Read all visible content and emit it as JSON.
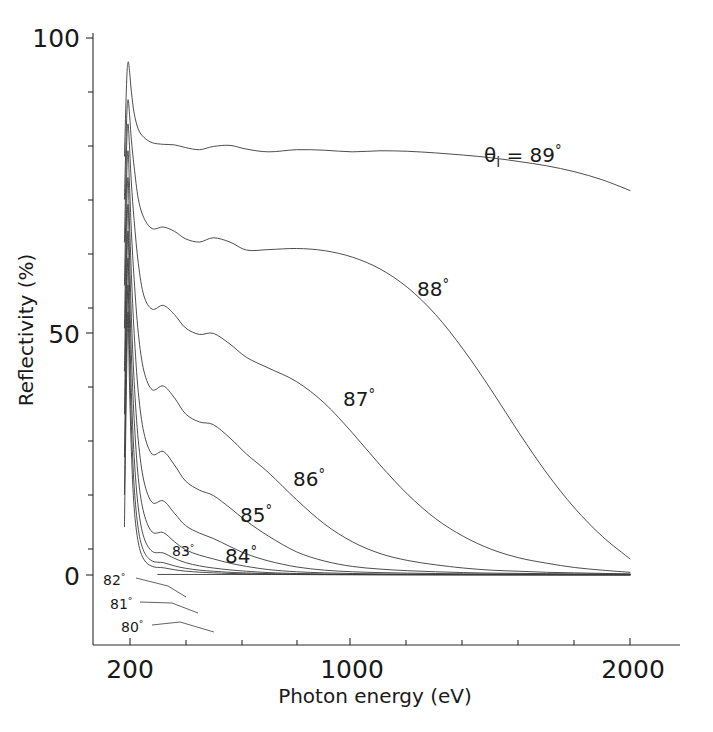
{
  "figure": {
    "background": "#ffffff",
    "line_color": "#3a3a3a",
    "axis_color": "#2b2b2b"
  },
  "axes": {
    "x_title": "Photon energy (eV)",
    "y_title": "Reflectivity (%)",
    "x_tick_labels": [
      "200",
      "1000",
      "2000"
    ],
    "y_tick_labels": [
      "100",
      "50",
      "0"
    ]
  },
  "labels": {
    "theta_main": "θ",
    "theta_sub": "i",
    "theta_eq": " = 89",
    "deg": "°",
    "c88": "88",
    "c87": "87",
    "c86": "86",
    "c85": "85",
    "c84": "84",
    "c83": "83",
    "c82": "82",
    "c81": "81",
    "c80": "80"
  },
  "chart_data": {
    "type": "line",
    "title": "",
    "subtitle": "",
    "xlabel": "Photon energy (eV)",
    "ylabel": "Reflectivity (%)",
    "xlim": [
      130,
      2000
    ],
    "ylim": [
      -10,
      100
    ],
    "x_scale": "linear",
    "y_scale": "linear",
    "xticks": [
      200,
      400,
      600,
      800,
      1000,
      1200,
      1400,
      1600,
      1800,
      2000
    ],
    "xticklabels": {
      "200": "200",
      "1000": "1000",
      "2000": "2000"
    },
    "yticks": [
      0,
      10,
      20,
      30,
      40,
      50,
      60,
      70,
      80,
      90,
      100
    ],
    "yticklabels": {
      "0": "0",
      "50": "50",
      "100": "100"
    },
    "grid": false,
    "legend": "inline-curve-annotations",
    "annotations": [
      {
        "text": "θi = 89°",
        "x": 1290,
        "y": 78.5
      },
      {
        "text": "88°",
        "x": 1090,
        "y": 54.0
      },
      {
        "text": "87°",
        "x": 810,
        "y": 34.5
      },
      {
        "text": "86°",
        "x": 625,
        "y": 19.5
      },
      {
        "text": "85°",
        "x": 440,
        "y": 13.0
      },
      {
        "text": "84°",
        "x": 415,
        "y": 5.0
      },
      {
        "text": "83°",
        "x": 300,
        "y": 5.8
      },
      {
        "text": "82°",
        "x": 205,
        "y": -1.0
      },
      {
        "text": "81°",
        "x": 218,
        "y": -5.5
      },
      {
        "text": "80°",
        "x": 250,
        "y": -9.0
      }
    ],
    "series": [
      {
        "name": "θi = 89°",
        "label": "89°",
        "x": [
          180,
          188,
          193,
          198,
          205,
          215,
          230,
          250,
          280,
          320,
          360,
          400,
          450,
          500,
          560,
          620,
          700,
          800,
          900,
          1000,
          1100,
          1200,
          1300,
          1400,
          1500,
          1600,
          1700,
          1800,
          1900,
          2000
        ],
        "y": [
          78,
          92,
          95.5,
          94,
          90,
          86,
          83,
          81.5,
          80.5,
          80.2,
          80.1,
          79.6,
          79.2,
          79.8,
          80.0,
          79.3,
          78.8,
          79.2,
          79.1,
          78.8,
          79.0,
          78.9,
          78.6,
          78.2,
          77.7,
          77.0,
          76.2,
          75.1,
          73.6,
          71.6
        ]
      },
      {
        "name": "88°",
        "label": "88°",
        "x": [
          180,
          188,
          193,
          198,
          205,
          215,
          230,
          250,
          280,
          320,
          360,
          400,
          450,
          500,
          560,
          620,
          700,
          800,
          900,
          1000,
          1100,
          1200,
          1300,
          1400,
          1500,
          1600,
          1700,
          1800,
          1900,
          2000
        ],
        "y": [
          70,
          85,
          88.5,
          86,
          81,
          76,
          70,
          66.5,
          64.5,
          64.8,
          64.0,
          62.6,
          62.0,
          62.8,
          62.0,
          60.5,
          60.6,
          60.8,
          60.4,
          59.2,
          57.0,
          53.5,
          48.5,
          42.0,
          34.5,
          26.5,
          19.0,
          12.5,
          7.2,
          3.0
        ]
      },
      {
        "name": "87°",
        "label": "87°",
        "x": [
          180,
          188,
          193,
          198,
          205,
          215,
          230,
          250,
          280,
          320,
          360,
          400,
          450,
          500,
          560,
          620,
          700,
          800,
          900,
          1000,
          1100,
          1200,
          1300,
          1400,
          1500,
          1600,
          1700,
          1800,
          1900,
          2000
        ],
        "y": [
          62,
          80,
          84,
          80,
          73,
          66,
          58,
          52,
          49.5,
          50.2,
          48.5,
          46.0,
          44.8,
          45.0,
          43.0,
          40.5,
          38.5,
          36.0,
          32.0,
          26.5,
          20.5,
          15.0,
          10.5,
          7.2,
          4.8,
          3.2,
          2.2,
          1.4,
          0.9,
          0.5
        ]
      },
      {
        "name": "86°",
        "label": "86°",
        "x": [
          180,
          188,
          193,
          198,
          205,
          215,
          230,
          250,
          280,
          320,
          360,
          400,
          450,
          500,
          560,
          620,
          700,
          800,
          900,
          1000,
          1100,
          1200,
          1300,
          1400,
          1500,
          1600,
          1700,
          1800,
          1900,
          2000
        ],
        "y": [
          54,
          74,
          79,
          73,
          64,
          55,
          45,
          38,
          34.5,
          35.2,
          33.0,
          30.0,
          28.5,
          28.0,
          25.5,
          22.5,
          19.0,
          14.0,
          9.5,
          6.2,
          4.0,
          2.7,
          1.9,
          1.3,
          0.9,
          0.7,
          0.5,
          0.4,
          0.3,
          0.2
        ]
      },
      {
        "name": "85°",
        "label": "85°",
        "x": [
          180,
          188,
          193,
          198,
          205,
          215,
          230,
          250,
          280,
          320,
          360,
          400,
          450,
          500,
          560,
          620,
          700,
          800,
          900,
          1000,
          1100,
          1200,
          1300,
          1400,
          1500,
          1600,
          1700,
          1800,
          1900,
          2000
        ],
        "y": [
          46,
          68,
          74,
          66,
          56,
          45,
          34,
          26.5,
          22.5,
          23.0,
          20.5,
          17.5,
          15.8,
          14.8,
          12.5,
          10.0,
          7.2,
          4.3,
          2.6,
          1.6,
          1.1,
          0.8,
          0.6,
          0.45,
          0.35,
          0.3,
          0.25,
          0.2,
          0.18,
          0.15
        ]
      },
      {
        "name": "84°",
        "label": "84°",
        "x": [
          180,
          188,
          193,
          198,
          205,
          215,
          230,
          250,
          280,
          320,
          360,
          400,
          450,
          500,
          560,
          620,
          700,
          800,
          900,
          1000,
          1100,
          1200,
          1300,
          1400,
          1500,
          1600,
          1700,
          1800,
          1900,
          2000
        ],
        "y": [
          38,
          62,
          69,
          60,
          48,
          36,
          25,
          17.5,
          13.5,
          13.8,
          11.5,
          9.2,
          7.8,
          6.8,
          5.3,
          3.9,
          2.6,
          1.5,
          0.9,
          0.6,
          0.45,
          0.35,
          0.28,
          0.22,
          0.18,
          0.16,
          0.14,
          0.12,
          0.1,
          0.1
        ]
      },
      {
        "name": "83°",
        "label": "83°",
        "x": [
          180,
          188,
          193,
          198,
          205,
          215,
          230,
          250,
          280,
          320,
          360,
          400,
          450,
          500,
          560,
          620,
          700,
          800,
          900,
          1000,
          1100,
          1200,
          1300,
          1400,
          1500,
          1600,
          1700,
          1800,
          1900,
          2000
        ],
        "y": [
          30,
          56,
          64,
          54,
          41,
          29,
          18,
          11.5,
          8.0,
          7.9,
          6.2,
          4.7,
          3.7,
          3.0,
          2.2,
          1.6,
          1.0,
          0.6,
          0.4,
          0.28,
          0.2,
          0.16,
          0.13,
          0.11,
          0.1,
          0.09,
          0.08,
          0.07,
          0.07,
          0.06
        ]
      },
      {
        "name": "82°",
        "label": "82°",
        "x": [
          180,
          188,
          193,
          198,
          205,
          215,
          230,
          250,
          280,
          320,
          360,
          400,
          450,
          500,
          560,
          620,
          700,
          800,
          900,
          1000,
          1200,
          1400,
          1600,
          1800,
          2000
        ],
        "y": [
          22,
          50,
          59,
          48,
          34,
          22,
          12.5,
          7.0,
          4.4,
          4.1,
          3.1,
          2.3,
          1.7,
          1.3,
          0.95,
          0.7,
          0.45,
          0.28,
          0.19,
          0.14,
          0.09,
          0.07,
          0.05,
          0.04,
          0.04
        ]
      },
      {
        "name": "81°",
        "label": "81°",
        "x": [
          180,
          188,
          193,
          198,
          205,
          215,
          230,
          250,
          280,
          320,
          360,
          400,
          450,
          500,
          560,
          620,
          700,
          800,
          900,
          1000,
          1200,
          1400,
          1600,
          1800,
          2000
        ],
        "y": [
          15,
          44,
          54,
          42,
          28,
          16.5,
          8.5,
          4.4,
          2.6,
          2.3,
          1.7,
          1.25,
          0.9,
          0.7,
          0.5,
          0.38,
          0.25,
          0.16,
          0.11,
          0.08,
          0.05,
          0.04,
          0.03,
          0.03,
          0.02
        ]
      },
      {
        "name": "80°",
        "label": "80°",
        "x": [
          180,
          188,
          193,
          198,
          205,
          215,
          230,
          250,
          280,
          320,
          360,
          400,
          450,
          500,
          560,
          620,
          700,
          800,
          900,
          1000,
          1200,
          1400,
          1600,
          1800,
          2000
        ],
        "y": [
          9,
          38,
          49,
          36,
          23,
          12.5,
          6.0,
          2.9,
          1.6,
          1.35,
          0.98,
          0.72,
          0.52,
          0.4,
          0.29,
          0.22,
          0.15,
          0.09,
          0.06,
          0.05,
          0.03,
          0.02,
          0.02,
          0.015,
          0.01
        ]
      }
    ],
    "baseline_y": -9.0,
    "note": "Grazing-incidence X-ray reflectivity vs photon energy for incidence angles 80-89 degrees"
  }
}
